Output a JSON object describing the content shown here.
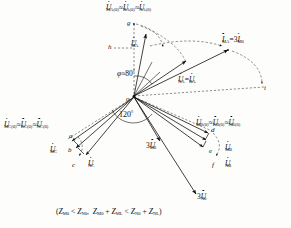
{
  "figure": {
    "type": "phasor-diagram",
    "title_caption": "(Zₘ₀ < Zₙ₀,  Zₘ₀ + Zₘₗ < Zₙ₀ + Zₙₗ)",
    "origin_label": "o",
    "angle_labels": [
      {
        "name": "phi-angle",
        "text": "φ ≈ 80",
        "superscript": "°"
      },
      {
        "name": "sector-angle",
        "text": "120",
        "superscript": "°"
      }
    ],
    "point_labels": [
      {
        "id": "g",
        "text": "g"
      },
      {
        "id": "h",
        "text": "h"
      },
      {
        "id": "i",
        "text": "i"
      },
      {
        "id": "a",
        "text": "a"
      },
      {
        "id": "b",
        "text": "b"
      },
      {
        "id": "c",
        "text": "c"
      },
      {
        "id": "d",
        "text": "d"
      },
      {
        "id": "e",
        "text": "e"
      },
      {
        "id": "f",
        "text": "f"
      }
    ],
    "phasor_labels": {
      "top_prefault_a": {
        "name": "prefault-phase-a",
        "parts": [
          "U",
          "MA(0)",
          "≈",
          "U",
          "KA(0)",
          "≈",
          "U",
          "NA(0)"
        ]
      },
      "current_ma": {
        "name": "current-ma",
        "parts": [
          "I",
          "MA",
          "=3",
          "I",
          "M0"
        ]
      },
      "u_ma": {
        "name": "u-ma",
        "base": "U",
        "sub": "MA"
      },
      "u_na_eq_u_ka": {
        "name": "u-na-equals-u-ka",
        "parts": [
          "U",
          "NA",
          "=",
          "U",
          "KA"
        ]
      },
      "left_prefault_c": {
        "name": "prefault-phase-c",
        "parts": [
          "U",
          "MC(0)",
          "≈",
          "U",
          "KC(0)",
          "≈",
          "U",
          "NC(0)"
        ]
      },
      "u_mc": {
        "name": "u-mc",
        "base": "U",
        "sub": "MC"
      },
      "u_nc": {
        "name": "u-nc",
        "base": "U",
        "sub": "NC"
      },
      "right_prefault_b": {
        "name": "prefault-phase-b",
        "parts": [
          "U",
          "MB(0)",
          "≈",
          "U",
          "KB(0)",
          "≈",
          "U",
          "NB(0)"
        ]
      },
      "u_mb": {
        "name": "u-mb",
        "base": "U",
        "sub": "MB"
      },
      "u_nb": {
        "name": "u-nb",
        "base": "U",
        "sub": "NB"
      },
      "three_u_m0": {
        "name": "three-u-m0",
        "prefix": "3",
        "base": "U",
        "sub": "M0"
      },
      "three_u_n0": {
        "name": "three-u-n0",
        "prefix": "3",
        "base": "U",
        "sub": "N0"
      }
    },
    "colors": {
      "ink": "#111111",
      "background": "#fdfdfc",
      "dashed": "#333333"
    }
  }
}
